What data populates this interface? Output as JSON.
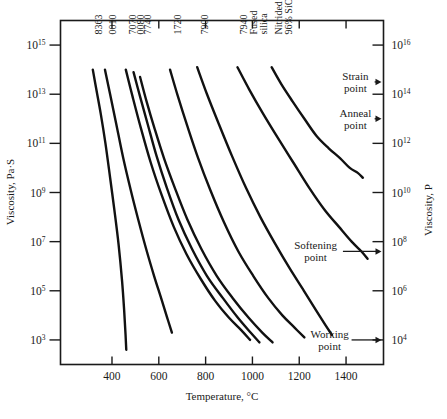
{
  "chart_data": {
    "type": "line",
    "title": "",
    "xlabel": "Temperature, °C",
    "ylabel_left": "Viscosity, Pa·S",
    "ylabel_right": "Viscosity, P",
    "xlim": [
      180,
      1560
    ],
    "xticks": [
      400,
      600,
      800,
      1000,
      1200,
      1400
    ],
    "xticklabels": [
      "400",
      "600",
      "800",
      "1000",
      "1200",
      "1400"
    ],
    "ylim_left_log10": [
      2,
      16
    ],
    "yticks_left_log10": [
      15,
      13,
      11,
      9,
      7,
      5,
      3
    ],
    "yticklabels_left": [
      "10¹⁵",
      "10¹³",
      "10¹¹",
      "10⁹",
      "10⁷",
      "10⁵",
      "10³"
    ],
    "yticks_left_mantissa": [
      "10",
      "10",
      "10",
      "10",
      "10",
      "10",
      "10"
    ],
    "yticks_left_exponents": [
      "15",
      "13",
      "11",
      "9",
      "7",
      "5",
      "3"
    ],
    "yticks_right_log10": [
      16,
      14,
      12,
      10,
      8,
      6,
      4
    ],
    "yticklabels_right": [
      "10¹⁶",
      "10¹⁴",
      "10¹²",
      "10¹⁰",
      "10⁸",
      "10⁶",
      "10⁴"
    ],
    "yticks_right_mantissa": [
      "10",
      "10",
      "10",
      "10",
      "10",
      "10",
      "10"
    ],
    "yticks_right_exponents": [
      "16",
      "14",
      "12",
      "10",
      "8",
      "6",
      "4"
    ],
    "grid": false,
    "legend_position": "inline-curve-labels",
    "series": [
      {
        "name": "8363",
        "label": "8363",
        "label_x": 340,
        "points": [
          [
            318,
            14.0
          ],
          [
            333,
            13.2
          ],
          [
            352,
            12.2
          ],
          [
            372,
            11.0
          ],
          [
            392,
            9.6
          ],
          [
            410,
            8.3
          ],
          [
            428,
            6.9
          ],
          [
            443,
            5.4
          ],
          [
            452,
            4.2
          ],
          [
            458,
            3.2
          ],
          [
            461,
            2.6
          ]
        ]
      },
      {
        "name": "0010",
        "label": "0010",
        "label_x": 398,
        "points": [
          [
            370,
            14.0
          ],
          [
            392,
            13.0
          ],
          [
            418,
            11.8
          ],
          [
            448,
            10.4
          ],
          [
            480,
            9.1
          ],
          [
            512,
            7.9
          ],
          [
            546,
            6.7
          ],
          [
            580,
            5.6
          ],
          [
            610,
            4.7
          ],
          [
            636,
            3.9
          ],
          [
            656,
            3.3
          ]
        ]
      },
      {
        "name": "7070",
        "label": "7070",
        "label_x": 484,
        "points": [
          [
            459,
            14.0
          ],
          [
            488,
            12.9
          ],
          [
            524,
            11.6
          ],
          [
            566,
            10.2
          ],
          [
            612,
            8.9
          ],
          [
            664,
            7.6
          ],
          [
            718,
            6.5
          ],
          [
            778,
            5.5
          ],
          [
            840,
            4.6
          ],
          [
            900,
            3.9
          ],
          [
            952,
            3.4
          ],
          [
            990,
            3.0
          ]
        ]
      },
      {
        "name": "0080",
        "label": "0080",
        "label_x": 520,
        "points": [
          [
            492,
            13.9
          ],
          [
            520,
            12.9
          ],
          [
            552,
            11.8
          ],
          [
            590,
            10.5
          ],
          [
            634,
            9.2
          ],
          [
            684,
            7.9
          ],
          [
            742,
            6.7
          ],
          [
            806,
            5.6
          ],
          [
            874,
            4.7
          ],
          [
            938,
            3.9
          ],
          [
            992,
            3.3
          ],
          [
            1030,
            2.9
          ]
        ]
      },
      {
        "name": "7740",
        "label": "7740",
        "label_x": 548,
        "points": [
          [
            520,
            13.7
          ],
          [
            548,
            12.7
          ],
          [
            582,
            11.6
          ],
          [
            622,
            10.4
          ],
          [
            668,
            9.2
          ],
          [
            722,
            7.9
          ],
          [
            782,
            6.7
          ],
          [
            848,
            5.6
          ],
          [
            916,
            4.7
          ],
          [
            984,
            3.9
          ],
          [
            1042,
            3.3
          ],
          [
            1086,
            2.9
          ]
        ]
      },
      {
        "name": "1720",
        "label": "1720",
        "label_x": 678,
        "points": [
          [
            648,
            14.0
          ],
          [
            682,
            12.9
          ],
          [
            722,
            11.7
          ],
          [
            768,
            10.4
          ],
          [
            820,
            9.1
          ],
          [
            878,
            7.8
          ],
          [
            940,
            6.6
          ],
          [
            1004,
            5.6
          ],
          [
            1068,
            4.7
          ],
          [
            1128,
            4.0
          ],
          [
            1180,
            3.5
          ],
          [
            1222,
            3.1
          ]
        ]
      },
      {
        "name": "7900",
        "label": "7900",
        "label_x": 794,
        "points": [
          [
            764,
            14.1
          ],
          [
            806,
            13.0
          ],
          [
            856,
            11.8
          ],
          [
            912,
            10.5
          ],
          [
            972,
            9.2
          ],
          [
            1034,
            8.0
          ],
          [
            1098,
            6.9
          ],
          [
            1160,
            5.9
          ],
          [
            1220,
            5.0
          ],
          [
            1272,
            4.2
          ],
          [
            1312,
            3.6
          ],
          [
            1340,
            3.2
          ]
        ]
      },
      {
        "name": "7940 Fused silica",
        "label": "7940\nFused\nsilica",
        "label_lines": [
          "7940",
          "Fused",
          "silica"
        ],
        "label_x": 960,
        "points": [
          [
            936,
            14.1
          ],
          [
            986,
            13.2
          ],
          [
            1046,
            12.2
          ],
          [
            1110,
            11.2
          ],
          [
            1176,
            10.2
          ],
          [
            1242,
            9.2
          ],
          [
            1308,
            8.3
          ],
          [
            1370,
            7.6
          ],
          [
            1424,
            7.0
          ],
          [
            1466,
            6.6
          ],
          [
            1492,
            6.3
          ]
        ]
      },
      {
        "name": "Nitrided 96% SiO2",
        "label": "Nitrided\n96% SiO₂",
        "label_lines": [
          "Nitrided",
          "96% SiO₂"
        ],
        "label_x": 1110,
        "points": [
          [
            1082,
            14.1
          ],
          [
            1124,
            13.4
          ],
          [
            1172,
            12.7
          ],
          [
            1222,
            12.0
          ],
          [
            1274,
            11.3
          ],
          [
            1326,
            10.8
          ],
          [
            1374,
            10.4
          ],
          [
            1416,
            10.0
          ],
          [
            1450,
            9.8
          ],
          [
            1472,
            9.6
          ]
        ]
      }
    ],
    "annotations": [
      {
        "name": "strain-point",
        "lines": [
          "Strain",
          "point"
        ],
        "value_log10_right": 14.5,
        "text_x": 1440,
        "arrow": true
      },
      {
        "name": "anneal-point",
        "lines": [
          "Anneal",
          "point"
        ],
        "value_log10_right": 13.0,
        "text_x": 1440,
        "arrow": true
      },
      {
        "name": "softening-point",
        "lines": [
          "Softening",
          "point"
        ],
        "value_log10_right": 7.6,
        "text_x": 1270,
        "arrow": true
      },
      {
        "name": "working-point",
        "lines": [
          "Working",
          "point"
        ],
        "value_log10_right": 4.0,
        "text_x": 1330,
        "arrow": true
      }
    ]
  },
  "axes": {
    "x_title": "Temperature, °C",
    "y_left_title": "Viscosity, Pa·S",
    "y_right_title": "Viscosity, P"
  }
}
